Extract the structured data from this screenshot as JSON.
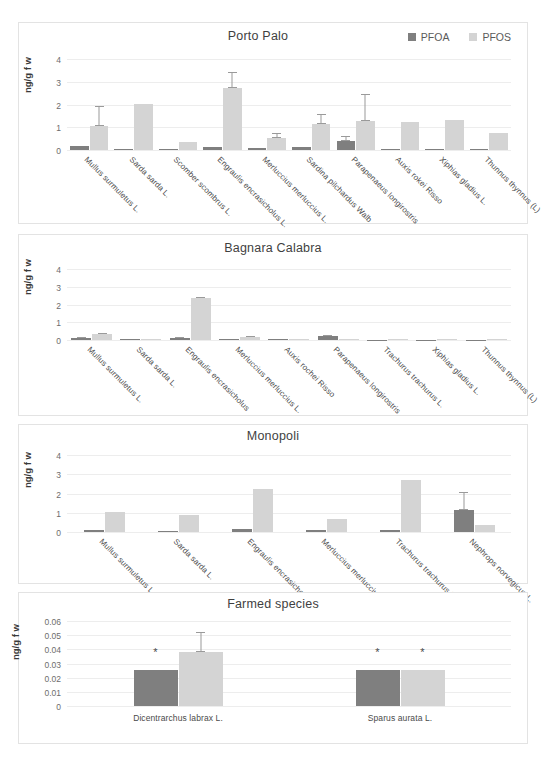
{
  "figure": {
    "y_axis_label": "ng/g f w",
    "legend": [
      {
        "label": "PFOA",
        "color": "#7f7f7f"
      },
      {
        "label": "PFOS",
        "color": "#d4d4d4"
      }
    ]
  },
  "chart_data": [
    {
      "type": "bar",
      "title": "Porto Palo",
      "xlabel": "",
      "ylabel": "ng/g f w",
      "ylim": [
        0,
        4
      ],
      "yticks": [
        0,
        1,
        2,
        3,
        4
      ],
      "grid": true,
      "legend_position": "top-right",
      "categories": [
        "Mullus surmuletus L.",
        "Sarda sarda L.",
        "Scomber scombrus L.",
        "Engraulis encrasicholus L.",
        "Merluccius merluccius L.",
        "Sardina pilchardus Walb",
        "Parapenaeus longirostris",
        "Auxis rokei Risso",
        "Xiphias gladius L.",
        "Thunnus thynnus (L)"
      ],
      "series": [
        {
          "name": "PFOA",
          "color": "#7f7f7f",
          "values": [
            0.17,
            0.05,
            0.04,
            0.15,
            0.09,
            0.14,
            0.41,
            0.04,
            0.04,
            0.05
          ],
          "errors": [
            0,
            0,
            0,
            0,
            0,
            0,
            0.22,
            0,
            0,
            0
          ]
        },
        {
          "name": "PFOS",
          "color": "#d4d4d4",
          "values": [
            1.05,
            2.03,
            0.35,
            2.73,
            0.51,
            1.15,
            1.26,
            1.25,
            1.3,
            0.73
          ],
          "errors": [
            0.87,
            0,
            0,
            0.68,
            0.24,
            0.42,
            1.18,
            0,
            0,
            0
          ]
        }
      ]
    },
    {
      "type": "bar",
      "title": "Bagnara Calabra",
      "xlabel": "",
      "ylabel": "ng/g f w",
      "ylim": [
        0,
        4
      ],
      "yticks": [
        0,
        1,
        2,
        3,
        4
      ],
      "grid": true,
      "categories": [
        "Mullus surmuletus L.",
        "Sarda sarda L.",
        "Engraulis encrasicholus",
        "Merluccius merluccius L.",
        "Auxis rochei Risso",
        "Parapenaeus longirostris",
        "Trachurus trachurus L.",
        "Xiphias gladius L.",
        "Thunnus thynnus (L)"
      ],
      "series": [
        {
          "name": "PFOA",
          "color": "#7f7f7f",
          "values": [
            0.14,
            0.03,
            0.12,
            0.08,
            0.04,
            0.24,
            0.02,
            0.02,
            0.02
          ],
          "errors": [
            0.05,
            0,
            0.04,
            0,
            0,
            0.04,
            0,
            0,
            0
          ]
        },
        {
          "name": "PFOS",
          "color": "#d4d4d4",
          "values": [
            0.33,
            0.04,
            2.34,
            0.19,
            0.05,
            0.03,
            0.03,
            0.03,
            0.03
          ],
          "errors": [
            0.06,
            0,
            0.1,
            0.03,
            0,
            0,
            0,
            0,
            0
          ]
        }
      ]
    },
    {
      "type": "bar",
      "title": "Monopoli",
      "xlabel": "",
      "ylabel": "ng/g f w",
      "ylim": [
        0,
        4
      ],
      "yticks": [
        0,
        1,
        2,
        3,
        4
      ],
      "grid": true,
      "categories": [
        "Mullus surmuletus L.",
        "Sarda sarda L.",
        "Engraulis encrasicholus",
        "Merluccius merluccius",
        "Trachurus trachurus L.",
        "Nephrops norvegicus L."
      ],
      "series": [
        {
          "name": "PFOA",
          "color": "#7f7f7f",
          "values": [
            0.13,
            0.06,
            0.14,
            0.12,
            0.12,
            1.12
          ],
          "errors": [
            0,
            0,
            0,
            0,
            0,
            0.98
          ]
        },
        {
          "name": "PFOS",
          "color": "#d4d4d4",
          "values": [
            1.06,
            0.87,
            2.26,
            0.69,
            2.68,
            0.36
          ]
        }
      ]
    },
    {
      "type": "bar",
      "title": "Farmed species",
      "xlabel": "",
      "ylabel": "ng/g f w",
      "ylim": [
        0,
        0.06
      ],
      "yticks": [
        "0",
        "0.01",
        "0.02",
        "0.03",
        "0.04",
        "0.05",
        "0.06"
      ],
      "grid": true,
      "categories": [
        "Dicentrarchus labrax L.",
        "Sparus aurata L."
      ],
      "series": [
        {
          "name": "PFOA",
          "color": "#7f7f7f",
          "values": [
            0.0253,
            0.0256
          ],
          "errors": [
            0,
            0
          ],
          "annotations": [
            "*",
            "*"
          ]
        },
        {
          "name": "PFOS",
          "color": "#d4d4d4",
          "values": [
            0.0378,
            0.0256
          ],
          "errors": [
            0.0145,
            0
          ],
          "annotations": [
            "",
            "*"
          ]
        }
      ]
    }
  ]
}
